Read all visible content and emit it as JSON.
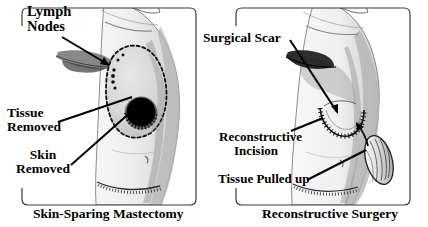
{
  "figure": {
    "background_color": "#ffffff",
    "ink_color": "#000000",
    "skin_fill_color": "#d8d8d8",
    "shade_color": "#9a9a9a"
  },
  "panels": [
    {
      "id": "left",
      "caption": "Skin-Sparing Mastectomy",
      "labels": [
        {
          "name": "lymph-nodes",
          "line1": "Lymph",
          "line2": "Nodes"
        },
        {
          "name": "tissue-removed",
          "line1": "Tissue",
          "line2": "Removed"
        },
        {
          "name": "skin-removed",
          "line1": "Skin",
          "line2": "Removed"
        }
      ]
    },
    {
      "id": "right",
      "caption": "Reconstructive Surgery",
      "labels": [
        {
          "name": "surgical-scar",
          "line1": "Surgical Scar",
          "line2": ""
        },
        {
          "name": "reconstructive-incision",
          "line1": "Reconstructive",
          "line2": "Incision"
        },
        {
          "name": "tissue-pulled-up",
          "line1": "Tissue Pulled up",
          "line2": ""
        }
      ]
    }
  ]
}
